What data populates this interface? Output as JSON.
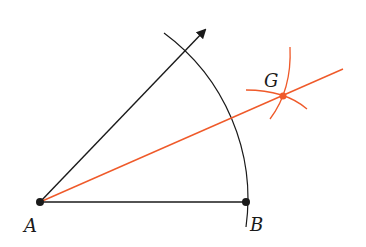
{
  "diagram": {
    "colors": {
      "black": "#1a1a1a",
      "orange": "#ef5a2a"
    },
    "points": {
      "A": {
        "label": "A",
        "x": 40,
        "y": 202
      },
      "B": {
        "label": "B",
        "x": 246,
        "y": 202
      },
      "G": {
        "label": "G",
        "x": 283,
        "y": 96
      }
    },
    "labels": {
      "A": "A",
      "B": "B",
      "G": "G"
    }
  }
}
